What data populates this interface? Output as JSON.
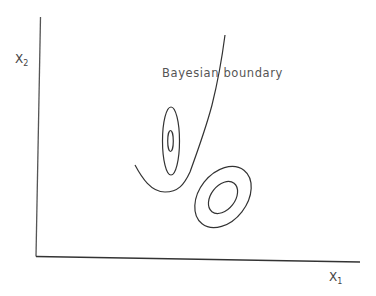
{
  "diagram": {
    "title": "",
    "boundary_label": "Bayesian boundary",
    "x_axis": {
      "label": "X",
      "subscript": "1"
    },
    "y_axis": {
      "label": "X",
      "subscript": "2"
    },
    "elements": [
      {
        "type": "axes",
        "origin": [
          36,
          256
        ],
        "x_end": [
          360,
          262
        ],
        "y_end": [
          40,
          17
        ]
      },
      {
        "type": "curve",
        "name": "bayesian-boundary",
        "description": "U-shaped curve rising steeply to the upper right"
      },
      {
        "type": "contour-set",
        "name": "class-1-contours",
        "center": [
          171,
          141
        ],
        "levels": 2,
        "shape": "vertical narrow ellipses"
      },
      {
        "type": "contour-set",
        "name": "class-2-contours",
        "center": [
          223,
          197
        ],
        "levels": 2,
        "shape": "tilted ellipses"
      }
    ],
    "colors": {
      "line": "#333333",
      "text": "#444444",
      "background": "#ffffff"
    }
  }
}
